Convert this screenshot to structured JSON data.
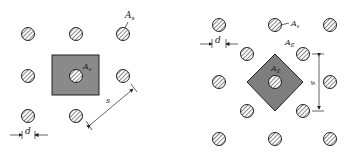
{
  "figure": {
    "left_panel": {
      "description": "Square arrangement of bars with effective area around center bar",
      "labels": {
        "bar_area": "A",
        "bar_area_sub": "s",
        "effective_area": "A",
        "effective_area_sub": "e",
        "spacing": "s",
        "diameter": "d"
      },
      "bars": [
        {
          "x": 28,
          "y": 34
        },
        {
          "x": 76,
          "y": 34
        },
        {
          "x": 123,
          "y": 34
        },
        {
          "x": 28,
          "y": 76
        },
        {
          "x": 76,
          "y": 76
        },
        {
          "x": 123,
          "y": 76
        },
        {
          "x": 28,
          "y": 116
        },
        {
          "x": 76,
          "y": 116
        }
      ]
    },
    "right_panel": {
      "description": "Staggered (triangular) arrangement of bars with diamond-shaped effective area",
      "labels": {
        "bar_area": "A",
        "bar_area_sub": "s",
        "effective_area": "A",
        "effective_area_sub": "E",
        "effective_area_inner": "A",
        "effective_area_inner_sub": "E",
        "spacing": "s",
        "diameter": "d"
      },
      "bars": [
        {
          "x": 219,
          "y": 25
        },
        {
          "x": 275,
          "y": 25
        },
        {
          "x": 330,
          "y": 25
        },
        {
          "x": 247,
          "y": 54
        },
        {
          "x": 303,
          "y": 54
        },
        {
          "x": 219,
          "y": 82
        },
        {
          "x": 275,
          "y": 82
        },
        {
          "x": 330,
          "y": 82
        },
        {
          "x": 247,
          "y": 111
        },
        {
          "x": 303,
          "y": 111
        },
        {
          "x": 219,
          "y": 139
        },
        {
          "x": 275,
          "y": 139
        },
        {
          "x": 330,
          "y": 139
        }
      ]
    },
    "colors": {
      "effective_area_fill": "#8a8a8a",
      "outline": "#222222",
      "hatch": "#555555"
    }
  }
}
